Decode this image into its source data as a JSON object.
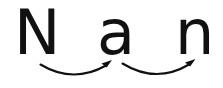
{
  "image": {
    "kind": "phonics-blending-diagram",
    "width": 223,
    "height": 88,
    "background_color": "#ffffff",
    "ink_color": "#111111"
  },
  "word": {
    "text": "Nan",
    "letters": [
      {
        "glyph": "N",
        "case": "uppercase",
        "name": "letter-n-capital"
      },
      {
        "glyph": "a",
        "case": "lowercase",
        "name": "letter-a"
      },
      {
        "glyph": "n",
        "case": "lowercase",
        "name": "letter-n"
      }
    ]
  },
  "arrows": [
    {
      "name": "blend-arrow-1",
      "from_letter": "N",
      "to_letter": "a",
      "direction": "left-to-right",
      "style": "curved-arc-concave-up",
      "color": "#111111"
    },
    {
      "name": "blend-arrow-2",
      "from_letter": "a",
      "to_letter": "n",
      "direction": "left-to-right",
      "style": "curved-arc-concave-up",
      "color": "#111111"
    }
  ]
}
